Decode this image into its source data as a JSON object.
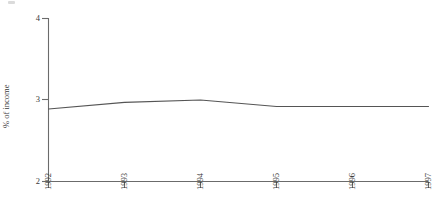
{
  "chart_data": {
    "type": "line",
    "title": "",
    "subtitle": "",
    "xlabel": "",
    "ylabel": "% of income",
    "categories": [
      "1992",
      "1993",
      "1994",
      "1995",
      "1996",
      "1997"
    ],
    "x": [
      1992,
      1993,
      1994,
      1995,
      1996,
      1997
    ],
    "values": [
      2.89,
      2.97,
      3.0,
      2.92,
      2.92,
      2.92
    ],
    "series": [
      {
        "name": "% of income",
        "values": [
          2.89,
          2.97,
          3.0,
          2.92,
          2.92,
          2.92
        ]
      }
    ],
    "xlim": [
      1992,
      1997
    ],
    "ylim": [
      2,
      4
    ],
    "yticks": [
      "2",
      "3",
      "4"
    ],
    "ytick_values": [
      2,
      3,
      4
    ],
    "xticks": [
      "1992",
      "1993",
      "1994",
      "1995",
      "1996",
      "1997"
    ],
    "grid": false,
    "legend": false,
    "legend_position": "none",
    "line_color": "#555555",
    "axis_color": "#6b6b6b",
    "text_color": "#3a3a3a",
    "background_color": "#ffffff",
    "annotations": []
  },
  "axes": {
    "y": {
      "title": "% of income",
      "ticks": [
        {
          "label": "4",
          "value": 4
        },
        {
          "label": "3",
          "value": 3
        },
        {
          "label": "2",
          "value": 2
        }
      ]
    },
    "x": {
      "title": "",
      "ticks": [
        {
          "label": "1992",
          "value": 1992
        },
        {
          "label": "1993",
          "value": 1993
        },
        {
          "label": "1994",
          "value": 1994
        },
        {
          "label": "1995",
          "value": 1995
        },
        {
          "label": "1996",
          "value": 1996
        },
        {
          "label": "1997",
          "value": 1997
        }
      ]
    }
  }
}
